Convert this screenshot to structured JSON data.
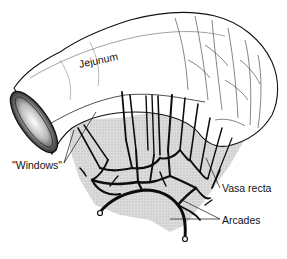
{
  "figure": {
    "labels": {
      "jejunum": "Jejunum",
      "windows": "\"Windows\"",
      "vasa_recta": "Vasa recta",
      "arcades": "Arcades"
    },
    "colors": {
      "background": "#ffffff",
      "ink": "#111111",
      "vessel": "#0d0d0d",
      "mesentery_shading": "#cfcfcf",
      "bowel_fill": "#ffffff"
    }
  }
}
